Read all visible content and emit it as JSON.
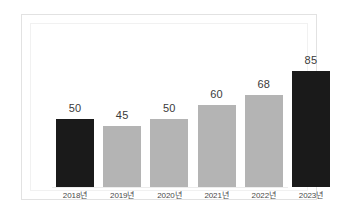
{
  "chart_data": {
    "type": "bar",
    "title": "",
    "subtitle": "",
    "xlabel": "",
    "ylabel": "",
    "categories": [
      "2018년",
      "2019년",
      "2020년",
      "2021년",
      "2022년",
      "2023년"
    ],
    "values": [
      50,
      45,
      50,
      60,
      68,
      85
    ],
    "value_labels": [
      "50",
      "45",
      "50",
      "60",
      "68",
      "85"
    ],
    "bar_colors": [
      "#1a1a1a",
      "#b4b4b4",
      "#b4b4b4",
      "#b4b4b4",
      "#b4b4b4",
      "#1a1a1a"
    ],
    "ylim": [
      0,
      100
    ],
    "grid": false,
    "legend": null,
    "legend_position": "none",
    "axis_visible": false,
    "annotations": []
  },
  "colors": {
    "page_background": "#ffffff",
    "card_background": "#ffffff",
    "card_border": "#e2e2e2",
    "plot_frame": "#f1f1f1",
    "bar_dark": "#1a1a1a",
    "bar_gray": "#b4b4b4",
    "value_text": "#3a3a3a",
    "category_text": "#4a4a4a",
    "baseline": "#ececec"
  }
}
